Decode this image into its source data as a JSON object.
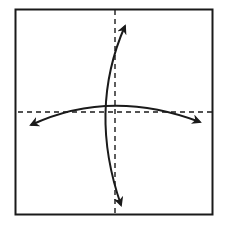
{
  "diagram": {
    "type": "origami-fold-diagram",
    "paper": {
      "x": 15,
      "y": 9,
      "width": 198,
      "height": 206,
      "stroke": "#1a1a1a"
    },
    "fold_lines": [
      {
        "id": "vertical-valley-fold",
        "style": "dashed",
        "x1": 115,
        "y1": 9,
        "x2": 115,
        "y2": 215
      },
      {
        "id": "horizontal-valley-fold",
        "style": "dashed",
        "x1": 18,
        "y1": 112,
        "x2": 212,
        "y2": 112
      }
    ],
    "arrows": [
      {
        "id": "vertical-fold-arrow",
        "heads": "both",
        "from": [
          121,
          205
        ],
        "to": [
          125,
          26
        ]
      },
      {
        "id": "horizontal-fold-arrow",
        "heads": "both",
        "from": [
          31,
          125
        ],
        "to": [
          200,
          122
        ]
      }
    ],
    "colors": {
      "line": "#1a1a1a",
      "background": "#ffffff"
    }
  }
}
